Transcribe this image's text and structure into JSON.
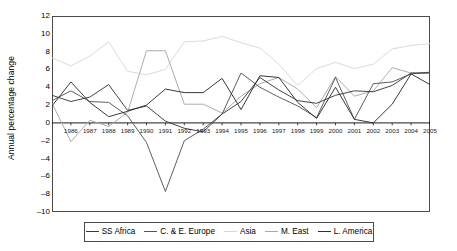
{
  "chart_data": {
    "type": "line",
    "title": "",
    "xlabel": "",
    "ylabel": "Annual percentage change",
    "ylim": [
      -10,
      12
    ],
    "ytickstep": 2,
    "grid": false,
    "legend_position": "bottom",
    "categories": [
      "1985",
      "1986",
      "1987",
      "1988",
      "1989",
      "1990",
      "1991",
      "1992",
      "1993",
      "1994",
      "1995",
      "1996",
      "1997",
      "1998",
      "1999",
      "2000",
      "2001",
      "2002",
      "2003",
      "2004",
      "2005"
    ],
    "yticks": [
      "12",
      "10",
      "8",
      "6",
      "4",
      "2",
      "0",
      "-2",
      "-4",
      "-6",
      "-8",
      "-10"
    ],
    "xticklabels": [
      "1986",
      "1987",
      "1988",
      "1989",
      "1990",
      "1991",
      "1992",
      "1993",
      "1994",
      "1995",
      "1996",
      "1997",
      "1998",
      "1999",
      "2000",
      "2001",
      "2002",
      "2003",
      "2004",
      "2005"
    ],
    "series": [
      {
        "name": "SS Africa",
        "color": "#3a3a3a",
        "values": [
          3.1,
          2.4,
          2.9,
          4.3,
          1.4,
          1.9,
          0.2,
          -0.6,
          -1.0,
          1.0,
          2.4,
          5.1,
          3.7,
          2.5,
          2.2,
          3.1,
          3.6,
          3.5,
          4.2,
          5.6,
          5.6
        ]
      },
      {
        "name": "C. & E. Europe",
        "color": "#555555",
        "values": [
          2.5,
          3.6,
          2.4,
          2.3,
          0.8,
          -2.2,
          -7.7,
          -2.0,
          -0.7,
          1.0,
          5.6,
          4.0,
          2.9,
          1.9,
          0.6,
          5.1,
          0.4,
          4.4,
          4.6,
          5.5,
          5.7
        ]
      },
      {
        "name": "Asia",
        "color": "#d8d8d8",
        "values": [
          7.3,
          6.4,
          7.5,
          9.1,
          5.8,
          5.4,
          6.0,
          9.1,
          9.2,
          9.7,
          9.0,
          8.4,
          6.6,
          4.2,
          6.1,
          6.8,
          6.1,
          6.6,
          8.3,
          8.7,
          8.9
        ]
      },
      {
        "name": "M. East",
        "color": "#a8a8a8",
        "values": [
          2.2,
          -2.1,
          0.3,
          -0.4,
          1.2,
          8.1,
          8.1,
          2.1,
          2.1,
          1.1,
          3.0,
          4.4,
          5.1,
          3.8,
          1.7,
          5.2,
          3.0,
          3.6,
          6.2,
          5.6,
          5.6
        ]
      },
      {
        "name": "L. America",
        "color": "#2e2e2e",
        "values": [
          1.9,
          4.6,
          2.3,
          0.7,
          1.3,
          2.0,
          3.8,
          3.4,
          3.4,
          5.0,
          1.5,
          5.3,
          5.1,
          2.3,
          0.5,
          4.0,
          0.4,
          0.0,
          2.1,
          5.5,
          4.3
        ]
      }
    ]
  },
  "legend": {
    "items": [
      {
        "label": "SS Africa",
        "color": "#3a3a3a"
      },
      {
        "label": "C. & E. Europe",
        "color": "#555555"
      },
      {
        "label": "Asia",
        "color": "#d8d8d8"
      },
      {
        "label": "M. East",
        "color": "#a8a8a8"
      },
      {
        "label": "L. America",
        "color": "#2e2e2e"
      }
    ]
  }
}
